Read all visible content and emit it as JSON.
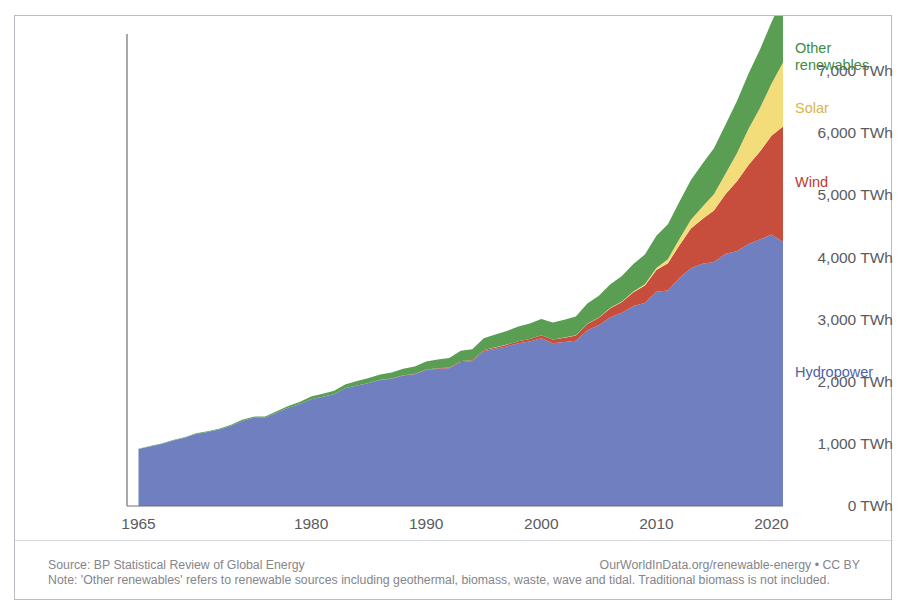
{
  "title_remnant": {
    "left_fragment": "",
    "mid_fragment": ""
  },
  "chart_data": {
    "type": "area",
    "stacked": true,
    "title": "",
    "subtitle": "",
    "xlabel": "",
    "ylabel": "",
    "xlim": [
      1964,
      2021
    ],
    "ylim": [
      0,
      7600
    ],
    "grid": false,
    "legend_position": "right-inline",
    "y_ticks": [
      0,
      1000,
      2000,
      3000,
      4000,
      5000,
      6000,
      7000
    ],
    "y_tick_labels": [
      "0 TWh",
      "1,000 TWh",
      "2,000 TWh",
      "3,000 TWh",
      "4,000 TWh",
      "5,000 TWh",
      "6,000 TWh",
      "7,000 TWh"
    ],
    "x_ticks": [
      1965,
      1980,
      1990,
      2000,
      2010,
      2020
    ],
    "x_tick_labels": [
      "1965",
      "1980",
      "1990",
      "2000",
      "2010",
      "2020"
    ],
    "x": [
      1965,
      1966,
      1967,
      1968,
      1969,
      1970,
      1971,
      1972,
      1973,
      1974,
      1975,
      1976,
      1977,
      1978,
      1979,
      1980,
      1981,
      1982,
      1983,
      1984,
      1985,
      1986,
      1987,
      1988,
      1989,
      1990,
      1991,
      1992,
      1993,
      1994,
      1995,
      1996,
      1997,
      1998,
      1999,
      2000,
      2001,
      2002,
      2003,
      2004,
      2005,
      2006,
      2007,
      2008,
      2009,
      2010,
      2011,
      2012,
      2013,
      2014,
      2015,
      2016,
      2017,
      2018,
      2019,
      2020,
      2021
    ],
    "series": [
      {
        "name": "Hydropower",
        "color": "#6f7fbf",
        "label_color": "#4f5fa8",
        "values": [
          918,
          960,
          1000,
          1055,
          1100,
          1160,
          1190,
          1230,
          1290,
          1370,
          1420,
          1420,
          1500,
          1580,
          1640,
          1720,
          1760,
          1800,
          1900,
          1940,
          1980,
          2030,
          2050,
          2100,
          2120,
          2190,
          2210,
          2220,
          2320,
          2330,
          2490,
          2530,
          2570,
          2620,
          2650,
          2700,
          2620,
          2640,
          2660,
          2830,
          2910,
          3040,
          3110,
          3220,
          3270,
          3450,
          3470,
          3670,
          3830,
          3900,
          3930,
          4060,
          4100,
          4220,
          4290,
          4370,
          4250
        ]
      },
      {
        "name": "Wind",
        "color": "#c74e3d",
        "label_color": "#c0392b",
        "values": [
          0,
          0,
          0,
          0,
          0,
          0,
          0,
          0,
          0,
          0,
          0,
          0,
          0,
          0,
          0,
          0,
          0,
          0,
          0,
          1,
          2,
          3,
          4,
          5,
          7,
          8,
          10,
          12,
          14,
          17,
          21,
          24,
          28,
          33,
          39,
          50,
          60,
          70,
          87,
          100,
          120,
          145,
          175,
          220,
          280,
          350,
          440,
          530,
          640,
          720,
          830,
          960,
          1130,
          1270,
          1420,
          1590,
          1860
        ]
      },
      {
        "name": "Solar",
        "color": "#f3dd7b",
        "label_color": "#d6b64a",
        "values": [
          0,
          0,
          0,
          0,
          0,
          0,
          0,
          0,
          0,
          0,
          0,
          0,
          0,
          0,
          0,
          0,
          0,
          0,
          0,
          0,
          0,
          0,
          0,
          0,
          0,
          0,
          0,
          0,
          0,
          0,
          0,
          1,
          1,
          1,
          1,
          1,
          2,
          2,
          3,
          4,
          5,
          7,
          9,
          13,
          20,
          32,
          65,
          100,
          140,
          200,
          260,
          330,
          450,
          580,
          700,
          840,
          1030
        ]
      },
      {
        "name": "Other renewables",
        "color": "#5a9e54",
        "label_color": "#3e8c3f",
        "values": [
          5,
          6,
          7,
          8,
          9,
          10,
          12,
          13,
          15,
          17,
          19,
          22,
          26,
          30,
          36,
          42,
          48,
          55,
          62,
          70,
          78,
          86,
          95,
          105,
          118,
          130,
          140,
          152,
          165,
          178,
          192,
          205,
          220,
          235,
          250,
          262,
          272,
          285,
          300,
          325,
          350,
          380,
          410,
          445,
          480,
          520,
          560,
          600,
          640,
          690,
          740,
          790,
          840,
          890,
          940,
          990,
          1040
        ]
      }
    ],
    "annotations": []
  },
  "series_labels": [
    {
      "name": "Other renewables",
      "line1": "Other",
      "line2": "renewables"
    },
    {
      "name": "Solar",
      "line1": "Solar",
      "line2": ""
    },
    {
      "name": "Wind",
      "line1": "Wind",
      "line2": ""
    },
    {
      "name": "Hydropower",
      "line1": "Hydropower",
      "line2": ""
    }
  ],
  "footer": {
    "source": "Source: BP Statistical Review of Global Energy",
    "credit": "OurWorldInData.org/renewable-energy • CC BY",
    "note": "Note: 'Other renewables' refers to renewable sources including geothermal, biomass, waste, wave and tidal. Traditional biomass is not included."
  }
}
